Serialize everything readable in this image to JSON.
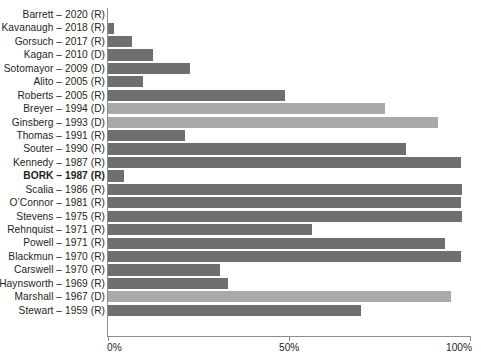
{
  "chart_data": {
    "type": "bar",
    "orientation": "horizontal",
    "title": "",
    "subtitle": "",
    "xlabel": "",
    "ylabel": "",
    "xlim": [
      0,
      100
    ],
    "grid": false,
    "legend": null,
    "xticks": [
      {
        "value": 0,
        "label": "0%"
      },
      {
        "value": 50,
        "label": "50%"
      },
      {
        "value": 100,
        "label": "100%"
      }
    ],
    "colors": {
      "republican_bar": "#6f6f6f",
      "democrat_bar": "#a9a9a9",
      "axis": "#8d8d8d",
      "text": "#231f20",
      "background": "#ffffff"
    },
    "categories": [
      "Barrett – 2020 (R)",
      "Kavanaugh – 2018 (R)",
      "Gorsuch – 2017 (R)",
      "Kagan – 2010 (D)",
      "Sotomayor – 2009 (D)",
      "Alito – 2005 (R)",
      "Roberts – 2005 (R)",
      "Breyer – 1994 (D)",
      "Ginsberg – 1993 (D)",
      "Thomas – 1991 (R)",
      "Souter – 1990 (R)",
      "Kennedy – 1987 (R)",
      "BORK – 1987 (R)",
      "Scalia – 1986 (R)",
      "O’Connor – 1981 (R)",
      "Stevens – 1975 (R)",
      "Rehnquist – 1971 (R)",
      "Powell – 1971 (R)",
      "Blackmun – 1970 (R)",
      "Carswell – 1970 (R)",
      "Haynsworth – 1969 (R)",
      "Marshall – 1967 (D)",
      "Stewart – 1959 (R)"
    ],
    "values": [
      0,
      1.7,
      6.6,
      12.4,
      22.7,
      9.7,
      48.9,
      76.5,
      91.2,
      21.3,
      82.3,
      97.5,
      4.4,
      97.8,
      97.5,
      97.8,
      56.3,
      93.1,
      97.5,
      30.9,
      33.1,
      94.8,
      69.9
    ],
    "rows": [
      {
        "label": "Barrett – 2020 (R)",
        "value": 0,
        "party": "R",
        "bold": false
      },
      {
        "label": "Kavanaugh – 2018 (R)",
        "value": 1.7,
        "party": "R",
        "bold": false
      },
      {
        "label": "Gorsuch – 2017 (R)",
        "value": 6.6,
        "party": "R",
        "bold": false
      },
      {
        "label": "Kagan – 2010 (D)",
        "value": 12.4,
        "party": "R",
        "bold": false
      },
      {
        "label": "Sotomayor – 2009 (D)",
        "value": 22.7,
        "party": "R",
        "bold": false
      },
      {
        "label": "Alito – 2005 (R)",
        "value": 9.7,
        "party": "R",
        "bold": false
      },
      {
        "label": "Roberts – 2005 (R)",
        "value": 48.9,
        "party": "R",
        "bold": false
      },
      {
        "label": "Breyer – 1994 (D)",
        "value": 76.5,
        "party": "D",
        "bold": false
      },
      {
        "label": "Ginsberg – 1993 (D)",
        "value": 91.2,
        "party": "D",
        "bold": false
      },
      {
        "label": "Thomas – 1991 (R)",
        "value": 21.3,
        "party": "R",
        "bold": false
      },
      {
        "label": "Souter – 1990 (R)",
        "value": 82.3,
        "party": "R",
        "bold": false
      },
      {
        "label": "Kennedy – 1987 (R)",
        "value": 97.5,
        "party": "R",
        "bold": false
      },
      {
        "label": "BORK – 1987 (R)",
        "value": 4.4,
        "party": "R",
        "bold": true
      },
      {
        "label": "Scalia – 1986 (R)",
        "value": 97.8,
        "party": "R",
        "bold": false
      },
      {
        "label": "O’Connor – 1981 (R)",
        "value": 97.5,
        "party": "R",
        "bold": false
      },
      {
        "label": "Stevens – 1975 (R)",
        "value": 97.8,
        "party": "R",
        "bold": false
      },
      {
        "label": "Rehnquist – 1971 (R)",
        "value": 56.3,
        "party": "R",
        "bold": false
      },
      {
        "label": "Powell – 1971 (R)",
        "value": 93.1,
        "party": "R",
        "bold": false
      },
      {
        "label": "Blackmun – 1970 (R)",
        "value": 97.5,
        "party": "R",
        "bold": false
      },
      {
        "label": "Carswell – 1970 (R)",
        "value": 30.9,
        "party": "R",
        "bold": false
      },
      {
        "label": "Haynsworth – 1969 (R)",
        "value": 33.1,
        "party": "R",
        "bold": false
      },
      {
        "label": "Marshall – 1967 (D)",
        "value": 94.8,
        "party": "D",
        "bold": false
      },
      {
        "label": "Stewart – 1959 (R)",
        "value": 69.9,
        "party": "R",
        "bold": false
      }
    ]
  }
}
